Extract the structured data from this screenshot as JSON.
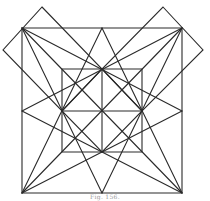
{
  "figure": {
    "caption": "Fig. 156.",
    "stroke_color": "#2a2a2a",
    "background": "#ffffff",
    "points": {
      "outer_tl": [
        22,
        28
      ],
      "outer_tm": [
        102,
        28
      ],
      "outer_tr": [
        182,
        28
      ],
      "outer_ml": [
        22,
        111
      ],
      "outer_mr": [
        182,
        111
      ],
      "outer_bl": [
        22,
        193
      ],
      "outer_bm": [
        102,
        193
      ],
      "outer_br": [
        182,
        193
      ],
      "inner_tl": [
        62,
        69
      ],
      "inner_tm": [
        102,
        69
      ],
      "inner_tr": [
        142,
        69
      ],
      "inner_ml": [
        62,
        111
      ],
      "center": [
        102,
        111
      ],
      "inner_mr": [
        142,
        111
      ],
      "inner_bl": [
        62,
        152
      ],
      "inner_bm": [
        102,
        152
      ],
      "inner_br": [
        142,
        152
      ],
      "left_diamond_top": [
        42,
        7
      ],
      "left_diamond_tip": [
        3,
        50
      ],
      "right_diamond_top": [
        163,
        7
      ],
      "right_diamond_tip": [
        203,
        50
      ]
    },
    "shapes": [
      {
        "name": "outer-square",
        "type": "polygon",
        "points": "22,28 182,28 182,193 22,193"
      },
      {
        "name": "inner-square",
        "type": "polygon",
        "points": "62,69 142,69 142,152 62,152"
      },
      {
        "name": "inner-diamond",
        "type": "polygon",
        "points": "102,69 142,111 102,152 62,111"
      },
      {
        "name": "left-corner-diamond",
        "type": "polygon",
        "points": "42,7 102,69 62,111 3,50"
      },
      {
        "name": "right-corner-diamond",
        "type": "polygon",
        "points": "163,7 203,50 142,111 102,69"
      }
    ],
    "lines": [
      {
        "name": "outer-diagonal-tl-br",
        "x1": 22,
        "y1": 28,
        "x2": 182,
        "y2": 193
      },
      {
        "name": "outer-diagonal-tr-bl",
        "x1": 182,
        "y1": 28,
        "x2": 22,
        "y2": 193
      },
      {
        "name": "inner-vertical",
        "x1": 102,
        "y1": 69,
        "x2": 102,
        "y2": 152
      },
      {
        "name": "inner-horizontal",
        "x1": 62,
        "y1": 111,
        "x2": 142,
        "y2": 111
      },
      {
        "name": "tl-to-right-mid",
        "x1": 22,
        "y1": 28,
        "x2": 182,
        "y2": 111
      },
      {
        "name": "tl-to-bottom-mid",
        "x1": 22,
        "y1": 28,
        "x2": 102,
        "y2": 193
      },
      {
        "name": "tr-to-left-mid",
        "x1": 182,
        "y1": 28,
        "x2": 22,
        "y2": 111
      },
      {
        "name": "tr-to-bottom-mid",
        "x1": 182,
        "y1": 28,
        "x2": 102,
        "y2": 193
      },
      {
        "name": "bl-to-top-mid",
        "x1": 22,
        "y1": 193,
        "x2": 102,
        "y2": 28
      },
      {
        "name": "bl-to-right-mid",
        "x1": 22,
        "y1": 193,
        "x2": 182,
        "y2": 111
      },
      {
        "name": "br-to-top-mid",
        "x1": 182,
        "y1": 193,
        "x2": 102,
        "y2": 28
      },
      {
        "name": "br-to-left-mid",
        "x1": 182,
        "y1": 193,
        "x2": 22,
        "y2": 111
      }
    ]
  }
}
